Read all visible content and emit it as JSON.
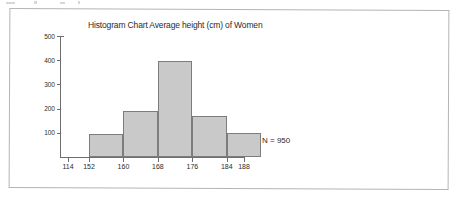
{
  "figure": {
    "border_color": "#b4b4b4",
    "background": "#ffffff"
  },
  "chart_data": {
    "type": "bar",
    "title": "Histogram Chart Average height (cm) of Women",
    "xlabel": "",
    "ylabel": "",
    "grid": false,
    "legend": null,
    "ylim": [
      0,
      500
    ],
    "xlim": [
      114,
      188
    ],
    "ytick_labels": [
      "100",
      "200",
      "300",
      "400",
      "500"
    ],
    "yticks": [
      100,
      200,
      300,
      400,
      500
    ],
    "xtick_labels": [
      "114",
      "152",
      "160",
      "168",
      "176",
      "184",
      "188"
    ],
    "xticks": [
      114,
      152,
      160,
      168,
      176,
      184,
      188
    ],
    "bin_width": 8,
    "bin_edges": [
      152,
      160,
      168,
      176,
      184,
      192
    ],
    "categories": [
      "152-160",
      "160-168",
      "168-176",
      "176-184",
      "184-192"
    ],
    "values": [
      93,
      190,
      396,
      170,
      100
    ],
    "bar_fill": "#c9c9c9",
    "bar_edge": "#7d7d7d",
    "annotations": [
      {
        "text": "N = 950",
        "x": 262,
        "y": 136
      }
    ]
  },
  "ticks": {
    "y": [
      {
        "label": "500",
        "value": 500
      },
      {
        "label": "400",
        "value": 400
      },
      {
        "label": "300",
        "value": 300
      },
      {
        "label": "200",
        "value": 200
      },
      {
        "label": "100",
        "value": 100
      }
    ],
    "x": [
      {
        "label": "114",
        "value": 114
      },
      {
        "label": "152",
        "value": 152
      },
      {
        "label": "160",
        "value": 160
      },
      {
        "label": "168",
        "value": 168
      },
      {
        "label": "176",
        "value": 176
      },
      {
        "label": "184",
        "value": 184
      },
      {
        "label": "188",
        "value": 188
      }
    ]
  },
  "annotation": {
    "sample_size": "N = 950"
  }
}
